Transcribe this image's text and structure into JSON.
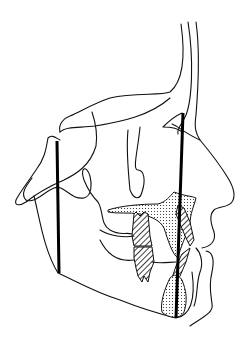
{
  "figure": {
    "type": "cephalometric-tracing",
    "colors": {
      "background": "#ffffff",
      "line": "#111111"
    },
    "reference_lines": [
      {
        "name": "posterior-vertical",
        "x": 57,
        "y1": 141,
        "y2": 273
      },
      {
        "name": "anterior-vertical",
        "x": 182,
        "y1": 113,
        "y2": 318
      }
    ]
  }
}
